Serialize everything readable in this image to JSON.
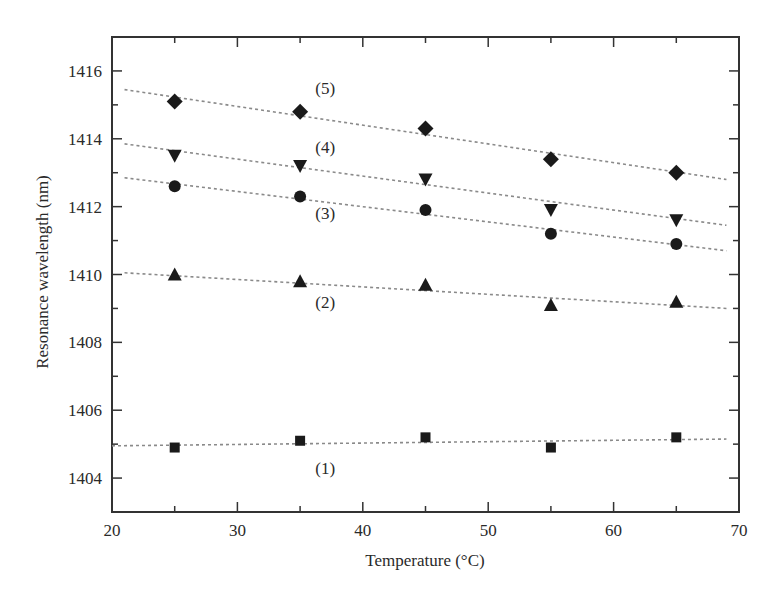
{
  "chart_data": {
    "type": "scatter",
    "title": "",
    "xlabel": "Temperature (°C)",
    "ylabel": "Resonance wavelength (nm)",
    "xlim": [
      20,
      70
    ],
    "ylim": [
      1403,
      1417
    ],
    "xticks": [
      20,
      30,
      40,
      50,
      60,
      70
    ],
    "yticks": [
      1404,
      1406,
      1408,
      1410,
      1412,
      1414,
      1416
    ],
    "grid": false,
    "legend": "inline labels",
    "x": [
      25,
      35,
      45,
      55,
      65
    ],
    "series": [
      {
        "name": "(1)",
        "marker": "square",
        "values": [
          1404.9,
          1405.1,
          1405.2,
          1404.9,
          1405.2
        ],
        "fit": [
          [
            20,
            1404.95
          ],
          [
            69,
            1405.15
          ]
        ],
        "label_pos": [
          37,
          1404.3
        ]
      },
      {
        "name": "(2)",
        "marker": "triangle-up",
        "values": [
          1410.0,
          1409.8,
          1409.7,
          1409.1,
          1409.2
        ],
        "fit": [
          [
            21,
            1410.05
          ],
          [
            69,
            1409.0
          ]
        ],
        "label_pos": [
          37,
          1409.2
        ]
      },
      {
        "name": "(3)",
        "marker": "circle",
        "values": [
          1412.6,
          1412.3,
          1411.9,
          1411.2,
          1410.9
        ],
        "fit": [
          [
            21,
            1412.85
          ],
          [
            69,
            1410.7
          ]
        ],
        "label_pos": [
          37,
          1411.8
        ]
      },
      {
        "name": "(4)",
        "marker": "triangle-down",
        "values": [
          1413.5,
          1413.2,
          1412.8,
          1411.9,
          1411.6
        ],
        "fit": [
          [
            21,
            1413.85
          ],
          [
            69,
            1411.45
          ]
        ],
        "label_pos": [
          37,
          1413.75
        ]
      },
      {
        "name": "(5)",
        "marker": "diamond",
        "values": [
          1415.1,
          1414.8,
          1414.3,
          1413.4,
          1413.0
        ],
        "fit": [
          [
            21,
            1415.45
          ],
          [
            69,
            1412.8
          ]
        ],
        "label_pos": [
          37,
          1415.5
        ]
      }
    ]
  },
  "colors": {
    "marker": "#1a1a1a",
    "fit_line": "#8a8a8a",
    "axis": "#333333"
  }
}
